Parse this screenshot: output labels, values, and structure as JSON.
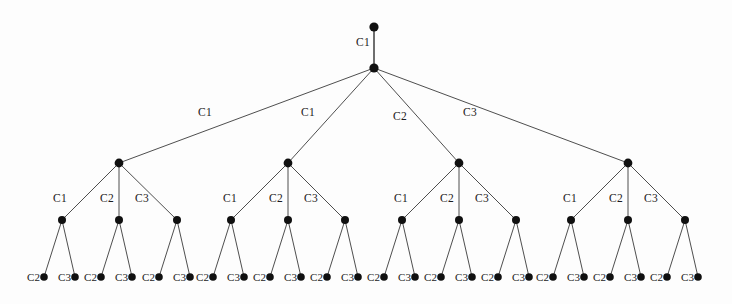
{
  "figure": {
    "type": "tree-diagram",
    "background_color": "#fdfdfd",
    "node_color": "#101010",
    "edge_color": "#3a3a3a",
    "width": 732,
    "height": 304
  },
  "root_edge": {
    "label": "C1",
    "label_x": 363,
    "label_y": 43,
    "from": {
      "x": 374,
      "y": 27
    },
    "to": {
      "x": 374,
      "y": 68
    }
  },
  "nodes": {
    "root": {
      "x": 374,
      "y": 27,
      "r": 4.6
    },
    "hub": {
      "x": 374,
      "y": 68,
      "r": 4.6
    },
    "level2": [
      {
        "x": 119,
        "y": 163,
        "r": 4.4
      },
      {
        "x": 288,
        "y": 163,
        "r": 4.4
      },
      {
        "x": 459,
        "y": 163,
        "r": 4.4
      },
      {
        "x": 628,
        "y": 163,
        "r": 4.4
      }
    ],
    "level3": [
      {
        "x": 62,
        "y": 220,
        "r": 4.0
      },
      {
        "x": 119,
        "y": 220,
        "r": 4.0
      },
      {
        "x": 177,
        "y": 220,
        "r": 4.0
      },
      {
        "x": 231,
        "y": 220,
        "r": 4.0
      },
      {
        "x": 288,
        "y": 220,
        "r": 4.0
      },
      {
        "x": 345,
        "y": 220,
        "r": 4.0
      },
      {
        "x": 402,
        "y": 220,
        "r": 4.0
      },
      {
        "x": 459,
        "y": 220,
        "r": 4.0
      },
      {
        "x": 516,
        "y": 220,
        "r": 4.0
      },
      {
        "x": 571,
        "y": 220,
        "r": 4.0
      },
      {
        "x": 628,
        "y": 220,
        "r": 4.0
      },
      {
        "x": 685,
        "y": 220,
        "r": 4.0
      }
    ],
    "leaves": [
      {
        "x": 44,
        "y": 277,
        "r": 3.8
      },
      {
        "x": 75,
        "y": 277,
        "r": 3.8
      },
      {
        "x": 101,
        "y": 277,
        "r": 3.8
      },
      {
        "x": 132,
        "y": 277,
        "r": 3.8
      },
      {
        "x": 159,
        "y": 277,
        "r": 3.8
      },
      {
        "x": 190,
        "y": 277,
        "r": 3.8
      },
      {
        "x": 213,
        "y": 277,
        "r": 3.8
      },
      {
        "x": 244,
        "y": 277,
        "r": 3.8
      },
      {
        "x": 270,
        "y": 277,
        "r": 3.8
      },
      {
        "x": 301,
        "y": 277,
        "r": 3.8
      },
      {
        "x": 327,
        "y": 277,
        "r": 3.8
      },
      {
        "x": 358,
        "y": 277,
        "r": 3.8
      },
      {
        "x": 384,
        "y": 277,
        "r": 3.8
      },
      {
        "x": 415,
        "y": 277,
        "r": 3.8
      },
      {
        "x": 441,
        "y": 277,
        "r": 3.8
      },
      {
        "x": 472,
        "y": 277,
        "r": 3.8
      },
      {
        "x": 498,
        "y": 277,
        "r": 3.8
      },
      {
        "x": 529,
        "y": 277,
        "r": 3.8
      },
      {
        "x": 553,
        "y": 277,
        "r": 3.8
      },
      {
        "x": 584,
        "y": 277,
        "r": 3.8
      },
      {
        "x": 610,
        "y": 277,
        "r": 3.8
      },
      {
        "x": 641,
        "y": 277,
        "r": 3.8
      },
      {
        "x": 667,
        "y": 277,
        "r": 3.8
      },
      {
        "x": 698,
        "y": 277,
        "r": 3.8
      }
    ]
  },
  "level2_edges": [
    {
      "label": "C1",
      "label_x": 205,
      "label_y": 113
    },
    {
      "label": "C1",
      "label_x": 308,
      "label_y": 113
    },
    {
      "label": "C2",
      "label_x": 400,
      "label_y": 117
    },
    {
      "label": "C3",
      "label_x": 470,
      "label_y": 113
    }
  ],
  "level3_edges": [
    {
      "label": "C1",
      "label_x": 60,
      "label_y": 199
    },
    {
      "label": "C2",
      "label_x": 107,
      "label_y": 199
    },
    {
      "label": "C3",
      "label_x": 142,
      "label_y": 199
    },
    {
      "label": "C1",
      "label_x": 230,
      "label_y": 199
    },
    {
      "label": "C2",
      "label_x": 276,
      "label_y": 199
    },
    {
      "label": "C3",
      "label_x": 311,
      "label_y": 199
    },
    {
      "label": "C1",
      "label_x": 401,
      "label_y": 199
    },
    {
      "label": "C2",
      "label_x": 447,
      "label_y": 199
    },
    {
      "label": "C3",
      "label_x": 482,
      "label_y": 199
    },
    {
      "label": "C1",
      "label_x": 570,
      "label_y": 199
    },
    {
      "label": "C2",
      "label_x": 616,
      "label_y": 199
    },
    {
      "label": "C3",
      "label_x": 651,
      "label_y": 199
    }
  ],
  "leaf_labels": [
    {
      "text": "C2",
      "label_x": 40,
      "label_y": 277
    },
    {
      "text": "C3",
      "label_x": 71,
      "label_y": 277
    },
    {
      "text": "C2",
      "label_x": 97,
      "label_y": 277
    },
    {
      "text": "C3",
      "label_x": 128,
      "label_y": 277
    },
    {
      "text": "C2",
      "label_x": 155,
      "label_y": 277
    },
    {
      "text": "C3",
      "label_x": 186,
      "label_y": 277
    },
    {
      "text": "C2",
      "label_x": 209,
      "label_y": 277
    },
    {
      "text": "C3",
      "label_x": 240,
      "label_y": 277
    },
    {
      "text": "C2",
      "label_x": 266,
      "label_y": 277
    },
    {
      "text": "C3",
      "label_x": 297,
      "label_y": 277
    },
    {
      "text": "C2",
      "label_x": 323,
      "label_y": 277
    },
    {
      "text": "C3",
      "label_x": 354,
      "label_y": 277
    },
    {
      "text": "C2",
      "label_x": 380,
      "label_y": 277
    },
    {
      "text": "C3",
      "label_x": 411,
      "label_y": 277
    },
    {
      "text": "C2",
      "label_x": 437,
      "label_y": 277
    },
    {
      "text": "C3",
      "label_x": 468,
      "label_y": 277
    },
    {
      "text": "C2",
      "label_x": 494,
      "label_y": 277
    },
    {
      "text": "C3",
      "label_x": 525,
      "label_y": 277
    },
    {
      "text": "C2",
      "label_x": 549,
      "label_y": 277
    },
    {
      "text": "C3",
      "label_x": 580,
      "label_y": 277
    },
    {
      "text": "C2",
      "label_x": 606,
      "label_y": 277
    },
    {
      "text": "C3",
      "label_x": 637,
      "label_y": 277
    },
    {
      "text": "C2",
      "label_x": 663,
      "label_y": 277
    },
    {
      "text": "C3",
      "label_x": 694,
      "label_y": 277
    }
  ]
}
